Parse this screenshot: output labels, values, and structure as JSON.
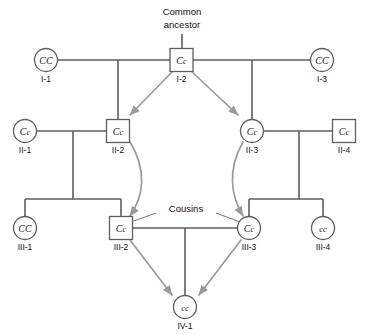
{
  "diagram": {
    "title_annotation": "Common ancestor",
    "cousins_annotation": "Cousins",
    "background_color": "#ffffff",
    "line_color": "#5e5e5e",
    "arrow_color": "#9a9a9a",
    "text_color": "#111111"
  },
  "generations": [
    {
      "label": "I",
      "individuals": [
        {
          "id": "I-1",
          "genotype": "CC",
          "allele1": "C",
          "allele2": "C",
          "sex": "female",
          "shape": "circle",
          "x": 46,
          "y": 60
        },
        {
          "id": "I-2",
          "genotype": "Cc",
          "allele1": "C",
          "allele2": "c",
          "sex": "male",
          "shape": "square",
          "x": 182,
          "y": 60
        },
        {
          "id": "I-3",
          "genotype": "CC",
          "allele1": "C",
          "allele2": "C",
          "sex": "female",
          "shape": "circle",
          "x": 322,
          "y": 60
        }
      ]
    },
    {
      "label": "II",
      "individuals": [
        {
          "id": "II-1",
          "genotype": "Cc",
          "allele1": "C",
          "allele2": "c",
          "sex": "female",
          "shape": "circle",
          "x": 25,
          "y": 131
        },
        {
          "id": "II-2",
          "genotype": "Cc",
          "allele1": "C",
          "allele2": "c",
          "sex": "male",
          "shape": "square",
          "x": 118,
          "y": 131
        },
        {
          "id": "II-3",
          "genotype": "Cc",
          "allele1": "C",
          "allele2": "c",
          "sex": "female",
          "shape": "circle",
          "x": 252,
          "y": 131
        },
        {
          "id": "II-4",
          "genotype": "Cc",
          "allele1": "C",
          "allele2": "c",
          "sex": "male",
          "shape": "square",
          "x": 344,
          "y": 131
        }
      ]
    },
    {
      "label": "III",
      "individuals": [
        {
          "id": "III-1",
          "genotype": "CC",
          "allele1": "C",
          "allele2": "C",
          "sex": "female",
          "shape": "circle",
          "x": 25,
          "y": 228
        },
        {
          "id": "III-2",
          "genotype": "Cc",
          "allele1": "C",
          "allele2": "c",
          "sex": "male",
          "shape": "square",
          "x": 121,
          "y": 228
        },
        {
          "id": "III-3",
          "genotype": "Cc",
          "allele1": "C",
          "allele2": "c",
          "sex": "female",
          "shape": "circle",
          "x": 249,
          "y": 228
        },
        {
          "id": "III-4",
          "genotype": "cc",
          "allele1": "c",
          "allele2": "c",
          "sex": "female",
          "shape": "circle",
          "x": 323,
          "y": 228
        }
      ]
    },
    {
      "label": "IV",
      "individuals": [
        {
          "id": "IV-1",
          "genotype": "cc",
          "allele1": "c",
          "allele2": "c",
          "sex": "female",
          "shape": "circle",
          "x": 185,
          "y": 307
        }
      ]
    }
  ],
  "inheritance_arrows": [
    {
      "from": "I-2",
      "to": "II-2",
      "style": "straight"
    },
    {
      "from": "I-2",
      "to": "II-3",
      "style": "straight"
    },
    {
      "from": "II-2",
      "to": "III-2",
      "style": "curved"
    },
    {
      "from": "II-3",
      "to": "III-3",
      "style": "curved"
    },
    {
      "from": "III-2",
      "to": "IV-1",
      "style": "straight"
    },
    {
      "from": "III-3",
      "to": "IV-1",
      "style": "straight"
    }
  ]
}
